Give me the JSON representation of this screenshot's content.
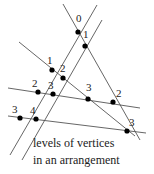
{
  "caption": {
    "line1": "levels of vertices",
    "line2": "in an arrangement"
  },
  "colors": {
    "line": "#555555",
    "vertex": "#000000",
    "text": "#222222"
  },
  "lines": [
    {
      "x1": 63,
      "y1": 4,
      "x2": 140,
      "y2": 140
    },
    {
      "x1": 97,
      "y1": 5,
      "x2": 10,
      "y2": 155
    },
    {
      "x1": 102,
      "y1": 20,
      "x2": 22,
      "y2": 160
    },
    {
      "x1": 19,
      "y1": 42,
      "x2": 135,
      "y2": 136
    },
    {
      "x1": 8,
      "y1": 88,
      "x2": 140,
      "y2": 108
    },
    {
      "x1": 8,
      "y1": 116,
      "x2": 146,
      "y2": 133
    }
  ],
  "vertices": [
    {
      "x": 78,
      "y": 32,
      "level": "0",
      "lx": 76,
      "ly": 22
    },
    {
      "x": 85,
      "y": 46,
      "level": "1",
      "lx": 83,
      "ly": 38
    },
    {
      "x": 52,
      "y": 70,
      "level": "1",
      "lx": 47,
      "ly": 64
    },
    {
      "x": 63,
      "y": 78,
      "level": "2",
      "lx": 60,
      "ly": 72
    },
    {
      "x": 38,
      "y": 92,
      "level": "2",
      "lx": 32,
      "ly": 87
    },
    {
      "x": 53,
      "y": 94,
      "level": "3",
      "lx": 48,
      "ly": 89
    },
    {
      "x": 88,
      "y": 99,
      "level": "3",
      "lx": 86,
      "ly": 91
    },
    {
      "x": 113,
      "y": 102,
      "level": "2",
      "lx": 116,
      "ly": 97
    },
    {
      "x": 20,
      "y": 118,
      "level": "3",
      "lx": 12,
      "ly": 113
    },
    {
      "x": 36,
      "y": 119,
      "level": "4",
      "lx": 30,
      "ly": 114
    },
    {
      "x": 127,
      "y": 131,
      "level": "3",
      "lx": 129,
      "ly": 126
    }
  ]
}
